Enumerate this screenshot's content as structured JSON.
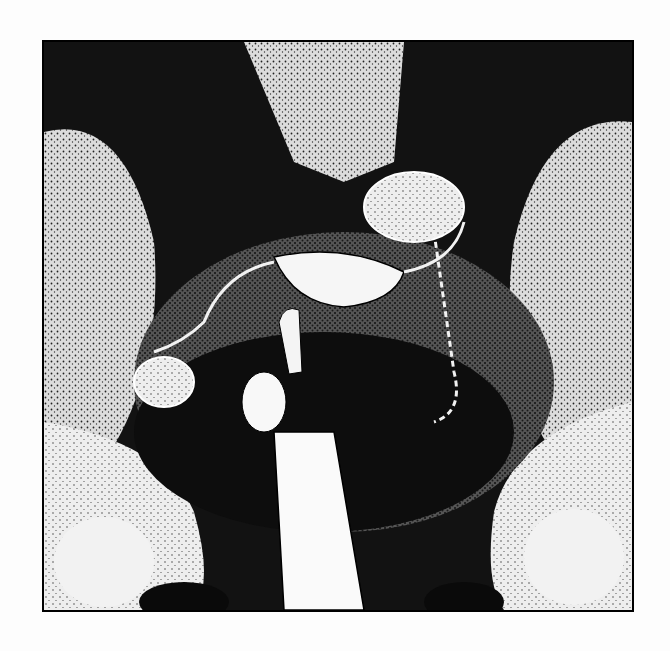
{
  "figure": {
    "colors": {
      "background": "#fdfdfd",
      "frame": "#000000",
      "dark": "#111111",
      "light": "#f4f4f4",
      "mid": "#8a8a8a"
    }
  }
}
